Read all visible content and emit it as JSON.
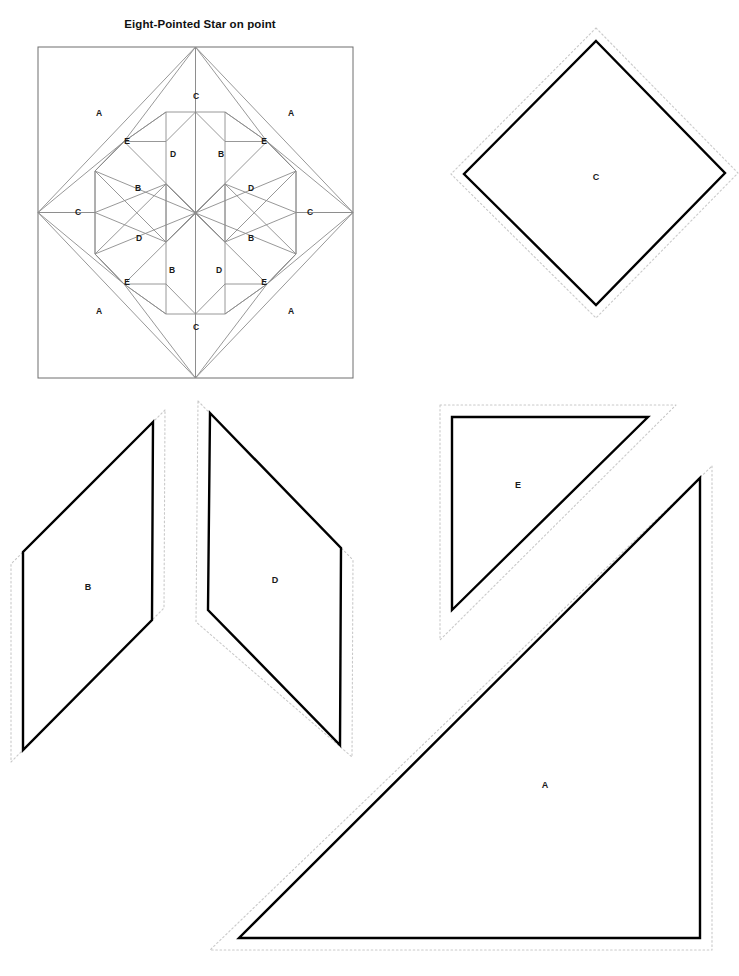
{
  "document": {
    "title": "Eight-Pointed Star on point",
    "page_width": 739,
    "page_height": 976,
    "background_color": "#ffffff",
    "ink_color": "#000000"
  },
  "colors": {
    "block_outline": "#6e6e6e",
    "block_seam_line": "#8c8c8c",
    "template_cut_line": "#000000",
    "template_seam_dotted": "#c9c9c9",
    "label_text": "#1a1a1a",
    "title_text": "#111111"
  },
  "block_diagram": {
    "name": "Eight-Pointed Star on point",
    "frame": {
      "x": 38,
      "y": 47,
      "width": 315,
      "height": 331
    },
    "center": {
      "x": 195,
      "y": 213
    },
    "piece_labels": [
      {
        "letter": "A",
        "x": 99,
        "y": 113
      },
      {
        "letter": "A",
        "x": 291,
        "y": 113
      },
      {
        "letter": "A",
        "x": 99,
        "y": 311
      },
      {
        "letter": "A",
        "x": 291,
        "y": 311
      },
      {
        "letter": "C",
        "x": 196,
        "y": 96
      },
      {
        "letter": "C",
        "x": 78,
        "y": 212
      },
      {
        "letter": "C",
        "x": 310,
        "y": 212
      },
      {
        "letter": "C",
        "x": 196,
        "y": 327
      },
      {
        "letter": "E",
        "x": 127,
        "y": 141
      },
      {
        "letter": "E",
        "x": 264,
        "y": 141
      },
      {
        "letter": "E",
        "x": 127,
        "y": 282
      },
      {
        "letter": "E",
        "x": 264,
        "y": 282
      },
      {
        "letter": "D",
        "x": 173,
        "y": 154
      },
      {
        "letter": "B",
        "x": 221,
        "y": 154
      },
      {
        "letter": "B",
        "x": 138,
        "y": 188
      },
      {
        "letter": "D",
        "x": 251,
        "y": 188
      },
      {
        "letter": "D",
        "x": 139,
        "y": 238
      },
      {
        "letter": "B",
        "x": 251,
        "y": 238
      },
      {
        "letter": "B",
        "x": 172,
        "y": 270
      },
      {
        "letter": "D",
        "x": 219,
        "y": 270
      }
    ]
  },
  "templates": [
    {
      "letter": "C",
      "shape": "square-on-point",
      "label_x": 596,
      "label_y": 177,
      "cut_points": "596,41 725,173 596,305 464,174",
      "seam_points": "596,28 738,173 596,318 451,174"
    },
    {
      "letter": "B",
      "shape": "parallelogram",
      "label_x": 88,
      "label_y": 587,
      "cut_points": "153,422 23,552 23,750 152,620",
      "seam_points": "165,410 11,564 11,762 164,608"
    },
    {
      "letter": "D",
      "shape": "parallelogram",
      "label_x": 275,
      "label_y": 580,
      "cut_points": "210,413 341,548 340,745 208,610",
      "seam_points": "198,401 353,560 352,757 196,622"
    },
    {
      "letter": "E",
      "shape": "right-triangle",
      "label_x": 518,
      "label_y": 485,
      "cut_points": "452,417 648,417 452,610",
      "seam_points": "440,405 676,405 440,640"
    },
    {
      "letter": "A",
      "shape": "right-triangle",
      "label_x": 545,
      "label_y": 785,
      "cut_points": "700,478 700,938 239,938",
      "seam_points": "712,466 712,950 210,950"
    }
  ]
}
